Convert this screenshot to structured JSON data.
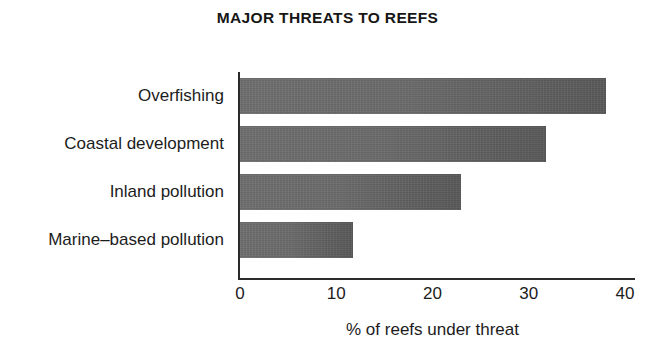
{
  "chart_data": {
    "type": "bar",
    "orientation": "horizontal",
    "title": "MAJOR THREATS TO REEFS",
    "categories": [
      "Overfishing",
      "Coastal development",
      "Inland pollution",
      "Marine–based pollution"
    ],
    "values": [
      38,
      31.8,
      23,
      11.7
    ],
    "xlabel": "% of reefs under threat",
    "ylabel": "",
    "xlim": [
      0,
      40
    ],
    "xticks": [
      0,
      10,
      20,
      30,
      40
    ],
    "xtick_labels": [
      "0",
      "10",
      "20",
      "30",
      "40"
    ],
    "grid": false,
    "legend": false,
    "series": [
      {
        "name": "% of reefs under threat",
        "color": "#666666",
        "values": [
          38,
          31.8,
          23,
          11.7
        ]
      }
    ],
    "colors": {
      "bar_fill": "#666666",
      "axis": "#2b2b2b",
      "text": "#1c1c1c",
      "background": "#ffffff"
    }
  }
}
